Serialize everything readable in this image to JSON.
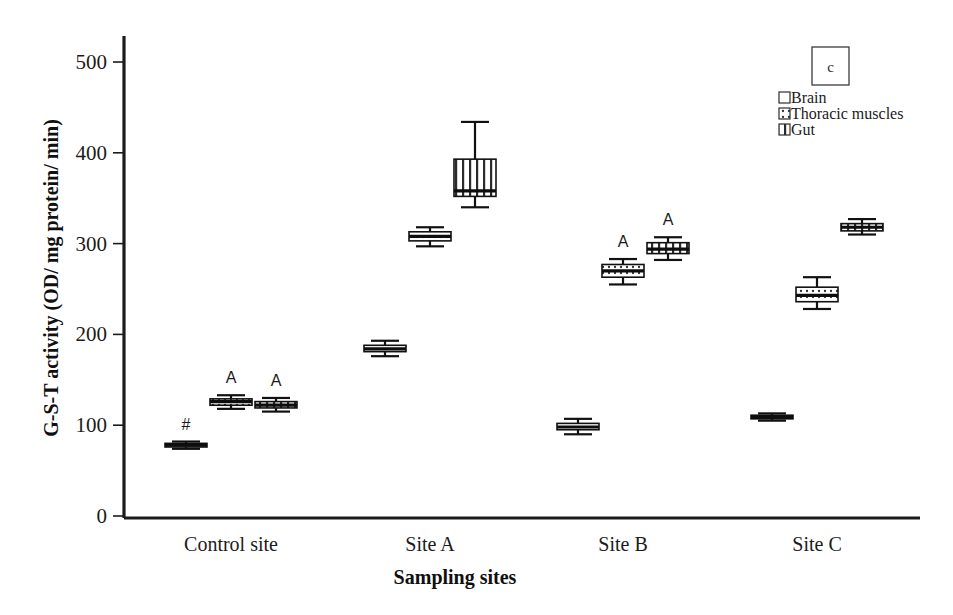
{
  "chart_data": {
    "type": "box",
    "title": "",
    "panel_label": "c",
    "xlabel": "Sampling sites",
    "ylabel": "G-S-T activity (OD/ mg protein/ min)",
    "categories": [
      "Control site",
      "Site A",
      "Site B",
      "Site C"
    ],
    "ylim": [
      0,
      520
    ],
    "yticks": [
      0,
      100,
      200,
      300,
      400,
      500
    ],
    "ytick_labels": [
      "0",
      "100",
      "200",
      "300",
      "400",
      "500"
    ],
    "grid": false,
    "legend_position": "top-right",
    "legend": [
      {
        "name": "Brain",
        "pattern": "open"
      },
      {
        "name": "Thoracic muscles",
        "pattern": "dotted"
      },
      {
        "name": "Gut",
        "pattern": "vertical-stripes"
      }
    ],
    "series": [
      {
        "name": "Brain",
        "pattern": "open",
        "boxes": [
          {
            "category": "Control site",
            "lower_whisker": 74,
            "q1": 76,
            "median": 78,
            "q3": 80,
            "upper_whisker": 82,
            "annotation": "#"
          },
          {
            "category": "Site A",
            "lower_whisker": 176,
            "q1": 181,
            "median": 184,
            "q3": 188,
            "upper_whisker": 193,
            "annotation": ""
          },
          {
            "category": "Site B",
            "lower_whisker": 90,
            "q1": 95,
            "median": 98,
            "q3": 102,
            "upper_whisker": 107,
            "annotation": ""
          },
          {
            "category": "Site C",
            "lower_whisker": 105,
            "q1": 107,
            "median": 109,
            "q3": 111,
            "upper_whisker": 113,
            "annotation": ""
          }
        ]
      },
      {
        "name": "Thoracic muscles",
        "pattern": "dotted",
        "boxes": [
          {
            "category": "Control site",
            "lower_whisker": 118,
            "q1": 122,
            "median": 126,
            "q3": 129,
            "upper_whisker": 133,
            "annotation": "A"
          },
          {
            "category": "Site A",
            "lower_whisker": 297,
            "q1": 303,
            "median": 308,
            "q3": 313,
            "upper_whisker": 318,
            "annotation": ""
          },
          {
            "category": "Site B",
            "lower_whisker": 255,
            "q1": 263,
            "median": 270,
            "q3": 277,
            "upper_whisker": 283,
            "annotation": "A"
          },
          {
            "category": "Site C",
            "lower_whisker": 228,
            "q1": 236,
            "median": 243,
            "q3": 252,
            "upper_whisker": 263,
            "annotation": ""
          }
        ]
      },
      {
        "name": "Gut",
        "pattern": "vertical-stripes",
        "boxes": [
          {
            "category": "Control site",
            "lower_whisker": 115,
            "q1": 119,
            "median": 122,
            "q3": 126,
            "upper_whisker": 130,
            "annotation": "A"
          },
          {
            "category": "Site A",
            "lower_whisker": 340,
            "q1": 352,
            "median": 358,
            "q3": 393,
            "upper_whisker": 434,
            "annotation": ""
          },
          {
            "category": "Site B",
            "lower_whisker": 282,
            "q1": 289,
            "median": 294,
            "q3": 301,
            "upper_whisker": 307,
            "annotation": "A"
          },
          {
            "category": "Site C",
            "lower_whisker": 310,
            "q1": 314,
            "median": 318,
            "q3": 322,
            "upper_whisker": 327,
            "annotation": ""
          }
        ]
      }
    ]
  },
  "colors": {
    "ink": "#111111",
    "axis": "#1b1b1b",
    "background": "#ffffff"
  }
}
